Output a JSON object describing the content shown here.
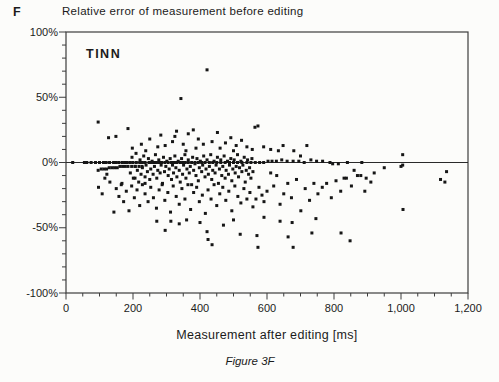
{
  "page": {
    "panel_letter": "F",
    "title": "Relative error of measurement before editing",
    "caption": "Figure 3F"
  },
  "chart_data": {
    "type": "scatter",
    "title": "Relative error of measurement before editing",
    "annotation": "TINN",
    "xlabel": "Measurement after editing [ms]",
    "ylabel": "Relative error [%]",
    "xlim": [
      0,
      1200
    ],
    "ylim": [
      -100,
      100
    ],
    "x_tick_values": [
      0,
      200,
      400,
      600,
      800,
      1000,
      1200
    ],
    "x_tick_labels": [
      "0",
      "200",
      "400",
      "600",
      "800",
      "1,000",
      "1,200"
    ],
    "x_minor_step": 50,
    "y_tick_values": [
      100,
      50,
      0,
      -50,
      -100
    ],
    "y_tick_labels": [
      "100%",
      "50%",
      "0%",
      "-50%",
      "-100%"
    ],
    "y_minor_step": 10,
    "zero_line": true,
    "grid": false,
    "legend": "none",
    "marker": {
      "shape": "square",
      "size_px": 3,
      "color": "#161616"
    },
    "frame_color": "#3c3c3c",
    "points": [
      [
        20,
        0
      ],
      [
        55,
        0
      ],
      [
        62,
        0
      ],
      [
        75,
        0
      ],
      [
        88,
        0
      ],
      [
        100,
        0
      ],
      [
        112,
        0
      ],
      [
        120,
        0
      ],
      [
        130,
        0
      ],
      [
        142,
        0
      ],
      [
        150,
        0
      ],
      [
        158,
        0
      ],
      [
        168,
        0
      ],
      [
        175,
        0
      ],
      [
        183,
        0
      ],
      [
        192,
        0
      ],
      [
        200,
        0
      ],
      [
        210,
        0
      ],
      [
        220,
        0
      ],
      [
        228,
        0
      ],
      [
        236,
        0
      ],
      [
        248,
        0
      ],
      [
        255,
        0
      ],
      [
        262,
        0
      ],
      [
        270,
        0
      ],
      [
        278,
        0
      ],
      [
        285,
        0
      ],
      [
        295,
        0
      ],
      [
        305,
        0
      ],
      [
        315,
        0
      ],
      [
        322,
        0
      ],
      [
        330,
        0
      ],
      [
        340,
        0
      ],
      [
        348,
        0
      ],
      [
        356,
        0
      ],
      [
        365,
        0
      ],
      [
        375,
        0
      ],
      [
        385,
        0
      ],
      [
        395,
        0
      ],
      [
        405,
        0
      ],
      [
        415,
        0
      ],
      [
        428,
        0
      ],
      [
        438,
        0
      ],
      [
        450,
        0
      ],
      [
        462,
        0
      ],
      [
        475,
        0
      ],
      [
        488,
        0
      ],
      [
        500,
        0
      ],
      [
        512,
        0
      ],
      [
        525,
        0
      ],
      [
        540,
        0
      ],
      [
        552,
        0
      ],
      [
        565,
        0
      ],
      [
        578,
        0
      ],
      [
        590,
        0
      ],
      [
        603,
        1
      ],
      [
        615,
        1
      ],
      [
        628,
        1
      ],
      [
        644,
        2
      ],
      [
        660,
        1
      ],
      [
        678,
        1
      ],
      [
        695,
        1
      ],
      [
        711,
        0
      ],
      [
        731,
        2
      ],
      [
        748,
        1
      ],
      [
        766,
        1
      ],
      [
        788,
        0
      ],
      [
        796,
        -1
      ],
      [
        813,
        -1
      ],
      [
        840,
        0
      ],
      [
        883,
        0
      ],
      [
        1005,
        -2
      ],
      [
        96,
        -6
      ],
      [
        105,
        -5
      ],
      [
        113,
        -5
      ],
      [
        121,
        -5
      ],
      [
        129,
        -4
      ],
      [
        137,
        -4
      ],
      [
        145,
        -4
      ],
      [
        153,
        -4
      ],
      [
        161,
        -3
      ],
      [
        169,
        -3
      ],
      [
        177,
        -3
      ],
      [
        185,
        -3
      ],
      [
        196,
        -3
      ],
      [
        207,
        -3
      ],
      [
        218,
        -3
      ],
      [
        227,
        -3
      ],
      [
        192,
        -8
      ],
      [
        197,
        4
      ],
      [
        201,
        -12
      ],
      [
        206,
        -3
      ],
      [
        209,
        7
      ],
      [
        213,
        -6
      ],
      [
        217,
        -15
      ],
      [
        221,
        2
      ],
      [
        224,
        -9
      ],
      [
        228,
        -4
      ],
      [
        232,
        5
      ],
      [
        236,
        -11
      ],
      [
        239,
        -2
      ],
      [
        243,
        -7
      ],
      [
        246,
        3
      ],
      [
        250,
        -13
      ],
      [
        253,
        -5
      ],
      [
        257,
        1
      ],
      [
        260,
        -9
      ],
      [
        264,
        -3
      ],
      [
        267,
        6
      ],
      [
        271,
        -12
      ],
      [
        274,
        -6
      ],
      [
        277,
        2
      ],
      [
        281,
        -8
      ],
      [
        284,
        -2
      ],
      [
        288,
        -16
      ],
      [
        291,
        4
      ],
      [
        294,
        -7
      ],
      [
        298,
        -3
      ],
      [
        301,
        1
      ],
      [
        305,
        -10
      ],
      [
        308,
        -5
      ],
      [
        311,
        3
      ],
      [
        315,
        -13
      ],
      [
        318,
        -2
      ],
      [
        321,
        -8
      ],
      [
        325,
        5
      ],
      [
        328,
        -4
      ],
      [
        331,
        -11
      ],
      [
        335,
        1
      ],
      [
        338,
        -6
      ],
      [
        341,
        -15
      ],
      [
        345,
        3
      ],
      [
        348,
        -9
      ],
      [
        351,
        -2
      ],
      [
        355,
        6
      ],
      [
        358,
        -12
      ],
      [
        361,
        -5
      ],
      [
        365,
        2
      ],
      [
        368,
        -8
      ],
      [
        371,
        -3
      ],
      [
        375,
        -17
      ],
      [
        378,
        4
      ],
      [
        381,
        -6
      ],
      [
        385,
        -1
      ],
      [
        388,
        -10
      ],
      [
        391,
        3
      ],
      [
        395,
        -14
      ],
      [
        398,
        -4
      ],
      [
        401,
        1
      ],
      [
        405,
        -7
      ],
      [
        408,
        -2
      ],
      [
        411,
        5
      ],
      [
        415,
        -11
      ],
      [
        418,
        -5
      ],
      [
        421,
        2
      ],
      [
        425,
        -9
      ],
      [
        428,
        -3
      ],
      [
        432,
        6
      ],
      [
        435,
        -13
      ],
      [
        438,
        -6
      ],
      [
        442,
        1
      ],
      [
        445,
        -8
      ],
      [
        448,
        -2
      ],
      [
        452,
        4
      ],
      [
        455,
        -16
      ],
      [
        458,
        -5
      ],
      [
        462,
        2
      ],
      [
        465,
        -10
      ],
      [
        468,
        -3
      ],
      [
        472,
        5
      ],
      [
        475,
        -12
      ],
      [
        478,
        -6
      ],
      [
        482,
        1
      ],
      [
        485,
        -9
      ],
      [
        488,
        -2
      ],
      [
        492,
        3
      ],
      [
        495,
        -14
      ],
      [
        498,
        -5
      ],
      [
        502,
        2
      ],
      [
        505,
        -8
      ],
      [
        508,
        -3
      ],
      [
        512,
        6
      ],
      [
        515,
        -11
      ],
      [
        518,
        -4
      ],
      [
        522,
        1
      ],
      [
        525,
        -7
      ],
      [
        528,
        -2
      ],
      [
        532,
        4
      ],
      [
        535,
        -15
      ],
      [
        538,
        -6
      ],
      [
        542,
        2
      ],
      [
        545,
        -9
      ],
      [
        548,
        -4
      ],
      [
        552,
        -12
      ],
      [
        555,
        3
      ],
      [
        558,
        -7
      ],
      [
        97,
        -19
      ],
      [
        108,
        -24
      ],
      [
        116,
        -12
      ],
      [
        122,
        -9
      ],
      [
        131,
        -15
      ],
      [
        167,
        -16
      ],
      [
        206,
        -12
      ],
      [
        236,
        -16
      ],
      [
        143,
        -38
      ],
      [
        150,
        -20
      ],
      [
        158,
        -26
      ],
      [
        165,
        -17
      ],
      [
        172,
        -30
      ],
      [
        180,
        -22
      ],
      [
        188,
        -37
      ],
      [
        196,
        -18
      ],
      [
        204,
        -27
      ],
      [
        212,
        -21
      ],
      [
        220,
        -33
      ],
      [
        228,
        -17
      ],
      [
        236,
        -24
      ],
      [
        245,
        -30
      ],
      [
        253,
        -19
      ],
      [
        261,
        -27
      ],
      [
        270,
        -35
      ],
      [
        278,
        -21
      ],
      [
        287,
        -17
      ],
      [
        295,
        -29
      ],
      [
        304,
        -23
      ],
      [
        312,
        -38
      ],
      [
        320,
        -18
      ],
      [
        329,
        -26
      ],
      [
        338,
        -32
      ],
      [
        346,
        -20
      ],
      [
        355,
        -28
      ],
      [
        364,
        -17
      ],
      [
        372,
        -36
      ],
      [
        381,
        -23
      ],
      [
        390,
        -19
      ],
      [
        398,
        -30
      ],
      [
        407,
        -25
      ],
      [
        416,
        -39
      ],
      [
        424,
        -21
      ],
      [
        433,
        -28
      ],
      [
        442,
        -17
      ],
      [
        450,
        -33
      ],
      [
        459,
        -24
      ],
      [
        468,
        -19
      ],
      [
        477,
        -29
      ],
      [
        486,
        -22
      ],
      [
        495,
        -37
      ],
      [
        504,
        -18
      ],
      [
        513,
        -26
      ],
      [
        522,
        -31
      ],
      [
        531,
        -20
      ],
      [
        540,
        -28
      ],
      [
        549,
        -23
      ],
      [
        558,
        -34
      ],
      [
        567,
        -28
      ],
      [
        576,
        -19
      ],
      [
        585,
        -25
      ],
      [
        591,
        -30
      ],
      [
        600,
        -22
      ],
      [
        611,
        -8
      ],
      [
        620,
        -18
      ],
      [
        629,
        -10
      ],
      [
        639,
        -32
      ],
      [
        650,
        -24
      ],
      [
        662,
        -16
      ],
      [
        673,
        -27
      ],
      [
        688,
        -13
      ],
      [
        701,
        -37
      ],
      [
        714,
        -20
      ],
      [
        727,
        -29
      ],
      [
        740,
        -16
      ],
      [
        752,
        -24
      ],
      [
        765,
        -19
      ],
      [
        778,
        -16
      ],
      [
        792,
        -27
      ],
      [
        806,
        -14
      ],
      [
        820,
        -22
      ],
      [
        837,
        -12
      ],
      [
        852,
        -18
      ],
      [
        870,
        -10
      ],
      [
        892,
        -22
      ],
      [
        910,
        -15
      ],
      [
        271,
        -45
      ],
      [
        296,
        -52
      ],
      [
        313,
        -45
      ],
      [
        338,
        -47
      ],
      [
        360,
        -44
      ],
      [
        400,
        -46
      ],
      [
        421,
        -53
      ],
      [
        424,
        -59
      ],
      [
        436,
        -63
      ],
      [
        470,
        -48
      ],
      [
        500,
        -44
      ],
      [
        520,
        -55
      ],
      [
        570,
        -56
      ],
      [
        573,
        -65
      ],
      [
        591,
        -42
      ],
      [
        639,
        -45
      ],
      [
        663,
        -57
      ],
      [
        675,
        -46
      ],
      [
        678,
        -65
      ],
      [
        734,
        -54
      ],
      [
        746,
        -43
      ],
      [
        821,
        -54
      ],
      [
        848,
        -60
      ],
      [
        96,
        31
      ],
      [
        127,
        19
      ],
      [
        149,
        20
      ],
      [
        185,
        26
      ],
      [
        198,
        11
      ],
      [
        225,
        14
      ],
      [
        238,
        9
      ],
      [
        250,
        18
      ],
      [
        274,
        12
      ],
      [
        283,
        21
      ],
      [
        296,
        13
      ],
      [
        318,
        16
      ],
      [
        325,
        20
      ],
      [
        330,
        24
      ],
      [
        343,
        49
      ],
      [
        350,
        14
      ],
      [
        358,
        9
      ],
      [
        365,
        22
      ],
      [
        380,
        25
      ],
      [
        388,
        11
      ],
      [
        395,
        18
      ],
      [
        410,
        14
      ],
      [
        421,
        71
      ],
      [
        436,
        16
      ],
      [
        452,
        23
      ],
      [
        460,
        11
      ],
      [
        476,
        15
      ],
      [
        492,
        19
      ],
      [
        500,
        9
      ],
      [
        508,
        13
      ],
      [
        524,
        17
      ],
      [
        540,
        12
      ],
      [
        556,
        10
      ],
      [
        564,
        27
      ],
      [
        573,
        28
      ],
      [
        590,
        12
      ],
      [
        611,
        10
      ],
      [
        634,
        9
      ],
      [
        648,
        13
      ],
      [
        680,
        9
      ],
      [
        700,
        5
      ],
      [
        719,
        13
      ],
      [
        1005,
        6
      ],
      [
        830,
        -12
      ],
      [
        860,
        -6
      ],
      [
        880,
        -10
      ],
      [
        896,
        -12
      ],
      [
        920,
        -8
      ],
      [
        950,
        -4
      ],
      [
        1000,
        -3
      ],
      [
        1006,
        -36
      ],
      [
        1118,
        -13
      ],
      [
        1131,
        -15
      ],
      [
        1136,
        -7
      ]
    ]
  }
}
